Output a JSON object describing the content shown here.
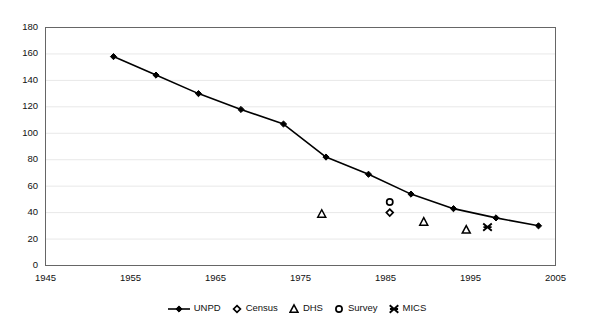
{
  "chart_data": {
    "type": "line",
    "title": "",
    "xlabel": "",
    "ylabel": "",
    "xlim": [
      1945,
      2005
    ],
    "ylim": [
      0,
      180
    ],
    "xticks": [
      1945,
      1955,
      1965,
      1975,
      1985,
      1995,
      2005
    ],
    "yticks": [
      0,
      20,
      40,
      60,
      80,
      100,
      120,
      140,
      160,
      180
    ],
    "grid": "horizontal",
    "legend_position": "bottom",
    "series": [
      {
        "name": "UNPD",
        "marker": "filled-diamond",
        "line": true,
        "color": "#000000",
        "points": [
          {
            "x": 1953,
            "y": 158
          },
          {
            "x": 1958,
            "y": 144
          },
          {
            "x": 1963,
            "y": 130
          },
          {
            "x": 1968,
            "y": 118
          },
          {
            "x": 1973,
            "y": 107
          },
          {
            "x": 1978,
            "y": 82
          },
          {
            "x": 1983,
            "y": 69
          },
          {
            "x": 1988,
            "y": 54
          },
          {
            "x": 1993,
            "y": 43
          },
          {
            "x": 1998,
            "y": 36
          },
          {
            "x": 2003,
            "y": 30
          }
        ]
      },
      {
        "name": "Census",
        "marker": "open-diamond",
        "line": false,
        "color": "#000000",
        "points": [
          {
            "x": 1985.5,
            "y": 40
          }
        ]
      },
      {
        "name": "DHS",
        "marker": "open-triangle",
        "line": false,
        "color": "#000000",
        "points": [
          {
            "x": 1977.5,
            "y": 39
          },
          {
            "x": 1989.5,
            "y": 33
          },
          {
            "x": 1994.5,
            "y": 27
          }
        ]
      },
      {
        "name": "Survey",
        "marker": "open-circle",
        "line": false,
        "color": "#000000",
        "points": [
          {
            "x": 1985.5,
            "y": 48
          }
        ]
      },
      {
        "name": "MICS",
        "marker": "star",
        "line": false,
        "color": "#000000",
        "points": [
          {
            "x": 1997,
            "y": 29
          }
        ]
      }
    ]
  },
  "axes": {
    "y_tick_labels": [
      "180",
      "160",
      "140",
      "120",
      "100",
      "80",
      "60",
      "40",
      "20",
      "0"
    ],
    "x_tick_labels": [
      "1945",
      "1955",
      "1965",
      "1975",
      "1985",
      "1995",
      "2005"
    ]
  },
  "legend": {
    "items": [
      {
        "label": "UNPD",
        "marker": "line-filled-diamond"
      },
      {
        "label": "Census",
        "marker": "open-diamond"
      },
      {
        "label": "DHS",
        "marker": "open-triangle"
      },
      {
        "label": "Survey",
        "marker": "open-circle"
      },
      {
        "label": "MICS",
        "marker": "star"
      }
    ]
  },
  "colors": {
    "axis": "#555555",
    "grid": "#e8e8e8",
    "series": "#000000",
    "background": "#ffffff"
  }
}
